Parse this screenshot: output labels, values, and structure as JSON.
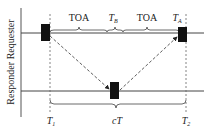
{
  "diagram": {
    "axis_label": "Responder Requester",
    "labels": {
      "toa_left": "TOA",
      "tb": "T",
      "tb_sub": "B",
      "toa_right": "TOA",
      "ta": "T",
      "ta_sub": "A",
      "t1": "T",
      "t1_sub": "1",
      "ct": "cT",
      "t2": "T",
      "t2_sub": "2"
    },
    "colors": {
      "line": "#444444",
      "block": "#111111"
    }
  }
}
